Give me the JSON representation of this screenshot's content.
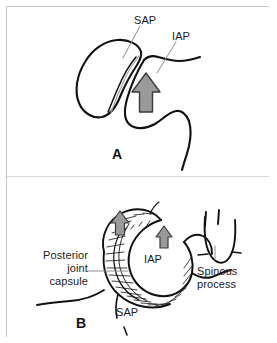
{
  "figure": {
    "type": "anatomical-line-drawing",
    "background_color": "#ffffff",
    "frame_color": "#c9c9c9",
    "ink_color": "#111111",
    "arrow_fill_color": "#9a9a9a",
    "arrow_outline_color": "#333333",
    "leader_line_color": "#8d8d8d"
  },
  "panels": [
    {
      "letter": "A",
      "letter_x": 112,
      "letter_y": 146,
      "labels": [
        {
          "text": "SAP",
          "x": 134,
          "y": 14,
          "align": "left"
        },
        {
          "text": "IAP",
          "x": 172,
          "y": 30,
          "align": "left"
        }
      ],
      "arrows": [
        {
          "name": "upward-force-arrow",
          "x": 146,
          "y": 96,
          "scale": 1.0
        }
      ]
    },
    {
      "letter": "B",
      "letter_x": 76,
      "letter_y": 318,
      "labels": [
        {
          "text": "Posterior",
          "x": 42,
          "y": 255,
          "align": "right"
        },
        {
          "text": "joint",
          "x": 42,
          "y": 268,
          "align": "right"
        },
        {
          "text": "capsule",
          "x": 42,
          "y": 281,
          "align": "right"
        },
        {
          "text": "IAP",
          "x": 144,
          "y": 259,
          "align": "left"
        },
        {
          "text": "Spinous",
          "x": 198,
          "y": 265,
          "align": "left"
        },
        {
          "text": "process",
          "x": 198,
          "y": 278,
          "align": "left"
        },
        {
          "text": "SAP",
          "x": 116,
          "y": 311,
          "align": "left"
        }
      ],
      "arrows": [
        {
          "name": "upward-force-arrow-left",
          "x": 120,
          "y": 225,
          "scale": 0.62
        },
        {
          "name": "upward-force-arrow-right",
          "x": 164,
          "y": 238,
          "scale": 0.58
        }
      ]
    }
  ],
  "label_texts": {
    "sap_a": "SAP",
    "iap_a": "IAP",
    "panel_a_letter": "A",
    "posterior": "Posterior",
    "joint": "joint",
    "capsule": "capsule",
    "iap_b": "IAP",
    "spinous": "Spinous",
    "process": "process",
    "sap_b": "SAP",
    "panel_b_letter": "B"
  }
}
